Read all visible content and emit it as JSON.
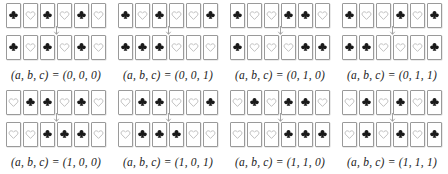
{
  "figure": {
    "suit_symbols": {
      "club": "club-suit-icon",
      "heart": "heart-suit-icon"
    },
    "arrow": "down-arrow-icon",
    "colors": {
      "club_fill": "#1a1a1a",
      "heart_stroke": "#a8a8a8",
      "card_border": "#9a9a9a",
      "card_face": "#ffffff",
      "arrow": "#9a9a9a",
      "caption_text": "#1a1a1a",
      "background": "#ffffff"
    },
    "panels": [
      {
        "caption": "(a, b, c) = (0, 0, 0)",
        "input": [
          "club",
          "heart",
          "club",
          "heart",
          "club",
          "heart"
        ],
        "output": [
          "club",
          "heart",
          "club",
          "heart",
          "club",
          "heart"
        ]
      },
      {
        "caption": "(a, b, c) = (0, 0, 1)",
        "input": [
          "club",
          "heart",
          "club",
          "heart",
          "heart",
          "club"
        ],
        "output": [
          "club",
          "club",
          "club",
          "heart",
          "heart",
          "heart"
        ]
      },
      {
        "caption": "(a, b, c) = (0, 1, 0)",
        "input": [
          "club",
          "heart",
          "heart",
          "club",
          "club",
          "heart"
        ],
        "output": [
          "club",
          "heart",
          "heart",
          "heart",
          "club",
          "club"
        ]
      },
      {
        "caption": "(a, b, c) = (0, 1, 1)",
        "input": [
          "club",
          "heart",
          "heart",
          "club",
          "heart",
          "club"
        ],
        "output": [
          "club",
          "club",
          "heart",
          "heart",
          "heart",
          "club"
        ]
      },
      {
        "caption": "(a, b, c) = (1, 0, 0)",
        "input": [
          "heart",
          "club",
          "club",
          "heart",
          "club",
          "heart"
        ],
        "output": [
          "heart",
          "heart",
          "club",
          "club",
          "club",
          "heart"
        ]
      },
      {
        "caption": "(a, b, c) = (1, 0, 1)",
        "input": [
          "heart",
          "club",
          "club",
          "heart",
          "heart",
          "club"
        ],
        "output": [
          "heart",
          "club",
          "club",
          "club",
          "heart",
          "heart"
        ]
      },
      {
        "caption": "(a, b, c) = (1, 1, 0)",
        "input": [
          "heart",
          "club",
          "heart",
          "club",
          "club",
          "heart"
        ],
        "output": [
          "heart",
          "heart",
          "heart",
          "club",
          "club",
          "club"
        ]
      },
      {
        "caption": "(a, b, c) = (1, 1, 1)",
        "input": [
          "heart",
          "club",
          "heart",
          "club",
          "heart",
          "club"
        ],
        "output": [
          "heart",
          "club",
          "heart",
          "club",
          "heart",
          "club"
        ]
      }
    ]
  }
}
